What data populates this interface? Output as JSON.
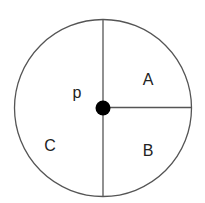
{
  "diagram": {
    "labels": {
      "A": "A",
      "B": "B",
      "C": "C",
      "p": "p"
    },
    "colors": {
      "stroke": "#555555",
      "dot": "#000000",
      "text": "#222222"
    }
  }
}
